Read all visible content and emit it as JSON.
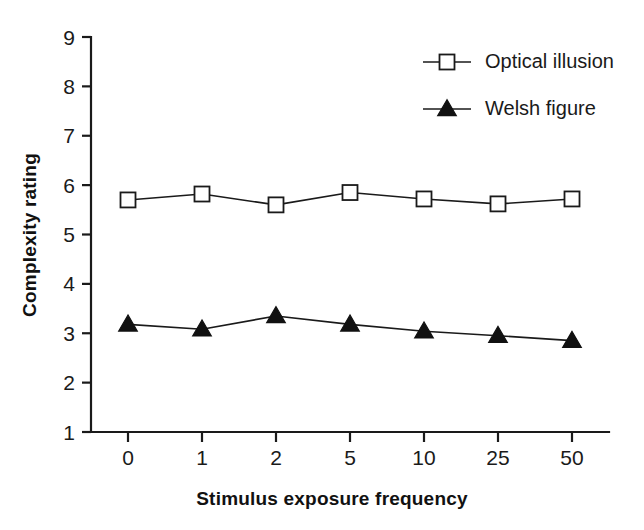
{
  "chart_data": {
    "type": "line",
    "title": "",
    "subtitle": "",
    "xlabel": "Stimulus exposure frequency",
    "ylabel": "Complexity rating",
    "categories": [
      "0",
      "1",
      "2",
      "5",
      "10",
      "25",
      "50"
    ],
    "xtick_labels": [
      "0",
      "1",
      "2",
      "5",
      "10",
      "25",
      "50"
    ],
    "ytick_labels": [
      "1",
      "2",
      "3",
      "4",
      "5",
      "6",
      "7",
      "8",
      "9"
    ],
    "ylim": [
      1,
      9
    ],
    "ytick_step": 1,
    "grid": false,
    "legend_position": "top-right",
    "series": [
      {
        "name": "Optical illusion",
        "marker": "open-square",
        "color": "#1a1a1a",
        "values": [
          5.7,
          5.82,
          5.6,
          5.85,
          5.72,
          5.62,
          5.72
        ]
      },
      {
        "name": "Welsh figure",
        "marker": "filled-triangle",
        "color": "#111111",
        "values": [
          3.18,
          3.08,
          3.35,
          3.18,
          3.04,
          2.95,
          2.85
        ]
      }
    ]
  },
  "legend": {
    "items": [
      {
        "label": "Optical illusion"
      },
      {
        "label": "Welsh figure"
      }
    ]
  },
  "axes": {
    "y_title": "Complexity rating",
    "x_title": "Stimulus exposure frequency"
  }
}
